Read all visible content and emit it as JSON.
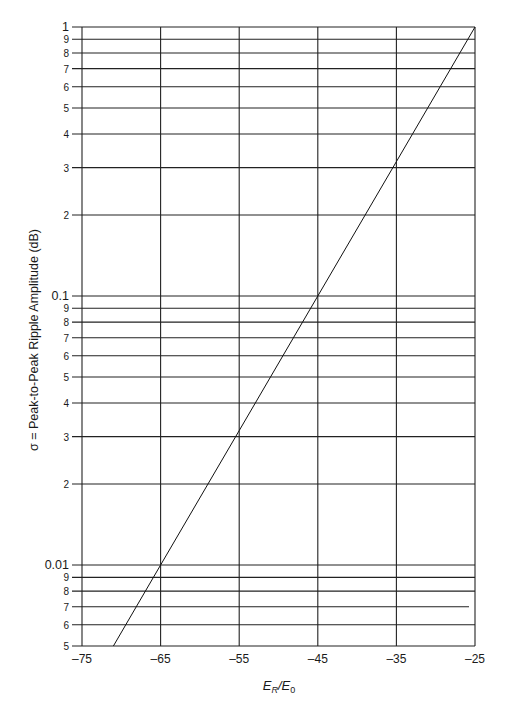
{
  "chart_data": {
    "type": "line",
    "title": "",
    "xlabel": "E_R/E_0",
    "xlabel_main": "E",
    "xlabel_sub1": "R",
    "xlabel_slash": "/E",
    "xlabel_sub2": "0",
    "ylabel": "σ = Peak-to-Peak Ripple Amplitude (dB)",
    "xscale": "linear",
    "yscale": "log",
    "xlim": [
      -75,
      -25
    ],
    "ylim": [
      0.005,
      1
    ],
    "grid": true,
    "x_ticks": [
      -75,
      -65,
      -55,
      -45,
      -35,
      -25
    ],
    "x_tick_labels": [
      "–75",
      "–65",
      "–55",
      "–45",
      "–35",
      "–25"
    ],
    "y_gridlines": [
      0.005,
      0.006,
      0.007,
      0.008,
      0.009,
      0.01,
      0.02,
      0.03,
      0.04,
      0.05,
      0.06,
      0.07,
      0.08,
      0.09,
      0.1,
      0.2,
      0.3,
      0.4,
      0.5,
      0.6,
      0.7,
      0.8,
      0.9,
      1
    ],
    "y_tick_labels": [
      "5",
      "6",
      "7",
      "8",
      "9",
      "0.01",
      "2",
      "3",
      "4",
      "5",
      "6",
      "7",
      "8",
      "9",
      "0.1",
      "2",
      "3",
      "4",
      "5",
      "6",
      "7",
      "8",
      "9",
      "1"
    ],
    "series": [
      {
        "name": "σ vs E_R/E_0",
        "x": [
          -71,
          -65,
          -55,
          -45,
          -35,
          -25
        ],
        "y": [
          0.005,
          0.01,
          0.0316,
          0.1,
          0.316,
          1
        ]
      }
    ],
    "legend": null
  }
}
